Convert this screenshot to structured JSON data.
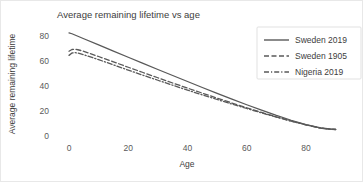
{
  "chart_data": {
    "type": "line",
    "title": "Average remaining lifetime vs age",
    "xlabel": "Age",
    "ylabel": "Average remaining lifetime",
    "xlim": [
      0,
      92
    ],
    "ylim": [
      0,
      88
    ],
    "xticks": [
      0,
      20,
      40,
      60,
      80
    ],
    "yticks": [
      0,
      20,
      40,
      60,
      80
    ],
    "xtick_labels": [
      "0",
      "20",
      "40",
      "60",
      "80"
    ],
    "ytick_labels": [
      "0",
      "20",
      "40",
      "60",
      "80"
    ],
    "grid": false,
    "legend_position": "top-right",
    "line_color": "#595959",
    "x": [
      0,
      1,
      2,
      3,
      4,
      5,
      10,
      15,
      20,
      25,
      30,
      35,
      40,
      45,
      50,
      55,
      60,
      65,
      70,
      75,
      80,
      85,
      88,
      90
    ],
    "series": [
      {
        "name": "Sweden 2019",
        "dash": "solid",
        "values": [
          82.5,
          81.8,
          80.8,
          79.8,
          78.8,
          77.8,
          72.9,
          67.9,
          63.0,
          58.1,
          53.2,
          48.4,
          43.6,
          38.8,
          34.1,
          29.5,
          25.0,
          20.7,
          16.5,
          12.6,
          9.1,
          6.4,
          5.6,
          5.3
        ]
      },
      {
        "name": "Sweden 1905",
        "dash": "dashed",
        "values": [
          67.8,
          69.2,
          69.4,
          69.0,
          68.4,
          67.7,
          63.6,
          59.3,
          55.0,
          50.8,
          46.6,
          42.4,
          38.3,
          34.3,
          30.3,
          26.4,
          22.6,
          18.9,
          15.3,
          12.0,
          8.9,
          6.3,
          5.5,
          5.2
        ]
      },
      {
        "name": "Nigeria 2019",
        "dash": "dashdot",
        "values": [
          64.5,
          66.4,
          66.7,
          66.3,
          65.7,
          65.0,
          61.1,
          56.9,
          52.7,
          48.6,
          44.6,
          40.6,
          36.7,
          32.9,
          29.2,
          25.5,
          22.0,
          18.5,
          15.1,
          11.9,
          8.9,
          6.3,
          5.5,
          5.2
        ]
      }
    ]
  }
}
